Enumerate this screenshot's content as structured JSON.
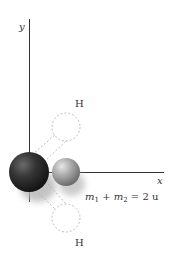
{
  "diagram": {
    "axes": {
      "x_label": "x",
      "y_label": "y"
    },
    "atoms": {
      "heavy": {
        "color": "#2a2a2a"
      },
      "light": {
        "color": "#9a9a9a"
      },
      "ghost_top_label": "H",
      "ghost_bottom_label": "H"
    },
    "equation": {
      "m": "m",
      "sub1": "1",
      "plus": " + ",
      "sub2": "2",
      "rhs": " = 2 u"
    }
  }
}
